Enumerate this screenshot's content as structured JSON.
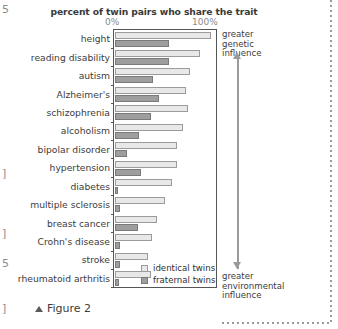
{
  "chart_data": {
    "type": "bar",
    "orientation": "horizontal",
    "title": "percent of twin pairs who share the trait",
    "xlabel": "",
    "ylabel": "",
    "xlim": [
      0,
      100
    ],
    "xticks": [
      "0%",
      "100%"
    ],
    "grid": false,
    "legend_position": "bottom-inside",
    "categories": [
      "height",
      "reading disability",
      "autism",
      "Alzheimer's",
      "schizophrenia",
      "alcoholism",
      "bipolar disorder",
      "hypertension",
      "diabetes",
      "multiple sclerosis",
      "breast cancer",
      "Crohn's disease",
      "stroke",
      "rheumatoid arthritis"
    ],
    "series": [
      {
        "name": "identical twins",
        "color": "#e8e8e8",
        "values": [
          92,
          82,
          72,
          68,
          70,
          65,
          60,
          60,
          55,
          48,
          40,
          36,
          32,
          35
        ]
      },
      {
        "name": "fraternal twins",
        "color": "#9e9e9e",
        "values": [
          52,
          52,
          37,
          42,
          35,
          23,
          12,
          25,
          3,
          5,
          22,
          5,
          5,
          4
        ]
      }
    ],
    "annotations": [
      {
        "text": "greater genetic influence",
        "position": "top-right",
        "arrow": "up"
      },
      {
        "text": "greater environmental influence",
        "position": "bottom-right",
        "arrow": "down"
      }
    ]
  },
  "legend": {
    "identical_label": "identical twins",
    "fraternal_label": "fraternal twins"
  },
  "annotations": {
    "top": {
      "line1": "greater",
      "line2": "genetic",
      "line3": "influence"
    },
    "bottom": {
      "line1": "greater",
      "line2": "environmental",
      "line3": "influence"
    }
  },
  "axis": {
    "tick_left": "0%",
    "tick_right": "100%"
  },
  "caption": {
    "text": "Figure 2"
  },
  "page_edge_marks": [
    "5",
    "]",
    "]",
    "]",
    "5",
    "]"
  ]
}
